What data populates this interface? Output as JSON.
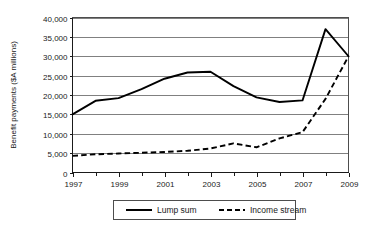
{
  "chart_data": {
    "type": "line",
    "title": "",
    "xlabel": "",
    "ylabel": "Benefit payments ($A millions)",
    "xlim": [
      1997,
      2009
    ],
    "ylim": [
      0,
      40000
    ],
    "grid": true,
    "legend_position": "bottom",
    "x_ticks": [
      1997,
      1999,
      2001,
      2003,
      2005,
      2007,
      2009
    ],
    "x_tick_labels": [
      "1997",
      "1999",
      "2001",
      "2003",
      "2005",
      "2007",
      "2009"
    ],
    "x_minor_ticks": [
      1998,
      2000,
      2002,
      2004,
      2006,
      2008
    ],
    "y_ticks": [
      0,
      5000,
      10000,
      15000,
      20000,
      25000,
      30000,
      35000,
      40000
    ],
    "y_tick_labels": [
      "0",
      "5,000",
      "10,000",
      "15,000",
      "20,000",
      "25,000",
      "30,000",
      "35,000",
      "40,000"
    ],
    "x": [
      1997,
      1998,
      1999,
      2000,
      2001,
      2002,
      2003,
      2004,
      2005,
      2006,
      2007,
      2008,
      2009
    ],
    "series": [
      {
        "name": "Lump sum",
        "style": "solid",
        "color": "#000000",
        "values": [
          15000,
          18500,
          19200,
          21500,
          24200,
          25800,
          26000,
          22300,
          19400,
          18200,
          18600,
          37000,
          30000
        ]
      },
      {
        "name": "Income stream",
        "style": "dashed",
        "color": "#000000",
        "values": [
          4300,
          4700,
          4900,
          5100,
          5300,
          5600,
          6200,
          7500,
          6500,
          8800,
          10400,
          19000,
          30000
        ]
      }
    ]
  },
  "legend": {
    "items": [
      {
        "label": "Lump sum",
        "style": "solid"
      },
      {
        "label": "Income stream",
        "style": "dashed"
      }
    ]
  }
}
